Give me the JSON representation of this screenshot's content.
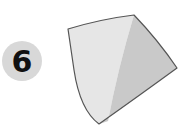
{
  "step": {
    "number": "6",
    "badge_color": "#d8d8d8",
    "number_color": "#111111"
  },
  "figure": {
    "vertices": {
      "top_left": [
        68,
        29
      ],
      "top_right": [
        134,
        15
      ],
      "right": [
        177,
        68
      ],
      "bottom": [
        99,
        124
      ]
    },
    "colors": {
      "light_face": "#e6e6e6",
      "dark_face": "#c9c9c9",
      "outline": "#555555"
    }
  }
}
